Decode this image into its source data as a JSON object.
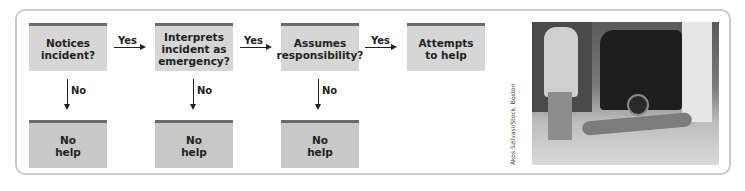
{
  "flowchart": {
    "steps": [
      {
        "label": "Notices\nincident?"
      },
      {
        "label": "Interprets\nincident as\nemergency?"
      },
      {
        "label": "Assumes\nresponsibility?"
      },
      {
        "label": "Attempts\nto help"
      }
    ],
    "yes_labels": [
      "Yes",
      "Yes",
      "Yes"
    ],
    "no_labels": [
      "No",
      "No",
      "No"
    ],
    "outcomes": [
      {
        "label": "No\nhelp"
      },
      {
        "label": "No\nhelp"
      },
      {
        "label": "No\nhelp"
      }
    ]
  },
  "photo": {
    "credit": "Akos Szilvasi/Stock, Boston"
  },
  "colors": {
    "box_fill": "#d6d6d6",
    "box_top_rule": "#6b6b6b",
    "frame_border": "#c9c9c9",
    "text": "#231f20"
  }
}
